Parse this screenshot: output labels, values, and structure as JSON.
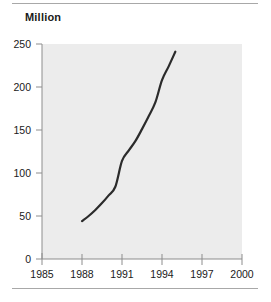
{
  "chart_data": {
    "type": "line",
    "title": "Million",
    "subtitle": "",
    "xlabel": "",
    "ylabel": "Million",
    "xlim": [
      1985,
      2000
    ],
    "ylim": [
      0,
      250
    ],
    "xticks": [
      1985,
      1988,
      1991,
      1994,
      1997,
      2000
    ],
    "yticks": [
      0,
      50,
      100,
      150,
      200,
      250
    ],
    "xtick_labels": [
      "1985",
      "1988",
      "1991",
      "1994",
      "1997",
      "2000"
    ],
    "ytick_labels": [
      "0",
      "50",
      "100",
      "150",
      "200",
      "250"
    ],
    "grid": false,
    "legend": null,
    "series": [
      {
        "name": "Million",
        "color": "#2b2b2b",
        "line_width": 2.2,
        "x": [
          1988,
          1988.5,
          1989,
          1989.5,
          1990,
          1990.5,
          1991,
          1991.5,
          1992,
          1992.5,
          1993,
          1993.5,
          1994,
          1994.5,
          1995
        ],
        "values": [
          44,
          50,
          57,
          65,
          74,
          84,
          114,
          126,
          137,
          151,
          166,
          182,
          208,
          224,
          241
        ]
      }
    ],
    "annotations": []
  },
  "figure": {
    "title_text": "Million",
    "plot_background": "#ececec",
    "axis_color": "#8d8d8d",
    "text_color": "#1a1a1a",
    "rule_color": "#a8a8a8",
    "line_color": "#2b2b2b"
  }
}
